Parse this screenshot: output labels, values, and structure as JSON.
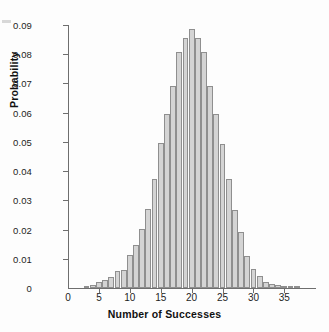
{
  "chart_data": {
    "type": "bar",
    "title": "",
    "xlabel": "Number of Successes",
    "ylabel": "Probability",
    "xlim": [
      0,
      38.5
    ],
    "ylim": [
      0,
      0.09
    ],
    "grid": false,
    "legend": null,
    "xticks": [
      0,
      5,
      10,
      15,
      20,
      25,
      30,
      35
    ],
    "xtick_labels": [
      "0",
      "5",
      "10",
      "15",
      "20",
      "25",
      "30",
      "35"
    ],
    "yticks": [
      0,
      0.01,
      0.02,
      0.03,
      0.04,
      0.05,
      0.06,
      0.07,
      0.08,
      0.09
    ],
    "ytick_labels": [
      "0",
      "0.01",
      "0.02",
      "0.03",
      "0.04",
      "0.05",
      "0.06",
      "0.07",
      "0.08",
      "0.09"
    ],
    "bar_fill_color": "#d4d4d4",
    "bar_edge_color": "#8f8f8f",
    "categories": [
      3,
      4,
      5,
      6,
      7,
      8,
      9,
      10,
      11,
      12,
      13,
      14,
      15,
      16,
      17,
      18,
      19,
      20,
      21,
      22,
      23,
      24,
      25,
      26,
      27,
      28,
      29,
      30,
      31,
      32,
      33,
      34,
      35,
      36,
      37
    ],
    "values": [
      0.0004,
      0.0011,
      0.0022,
      0.0026,
      0.0039,
      0.0058,
      0.0063,
      0.0113,
      0.0148,
      0.0203,
      0.0272,
      0.0374,
      0.0496,
      0.0594,
      0.0693,
      0.0809,
      0.0857,
      0.0885,
      0.0857,
      0.0809,
      0.0693,
      0.0594,
      0.0492,
      0.0372,
      0.0268,
      0.0191,
      0.011,
      0.0065,
      0.004,
      0.0022,
      0.0013,
      0.001,
      0.0008,
      0.0005,
      0.0003
    ]
  },
  "axes": {
    "x_title": "Number of Successes",
    "y_title": "Probability"
  }
}
